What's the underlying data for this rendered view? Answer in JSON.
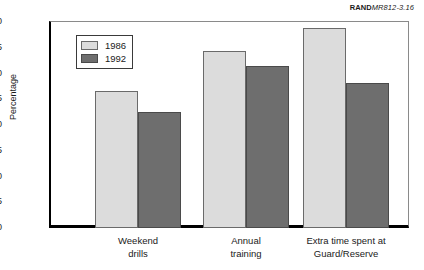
{
  "credit": {
    "rand": "RAND",
    "document": "MR812-3.16"
  },
  "chart_data": {
    "type": "bar",
    "title": "",
    "xlabel": "",
    "ylabel": "Percentage",
    "ylim": [
      0,
      40
    ],
    "ytick_step": 5,
    "yminor_step": 2.5,
    "grid": false,
    "legend_position": "upper-left-inside",
    "categories": [
      "Weekend\ndrills",
      "Annual\ntraining",
      "Extra time spent at\nGuard/Reserve"
    ],
    "ytick_labels": [
      "0",
      "5",
      "10",
      "15",
      "20",
      "25",
      "30",
      "35",
      "40"
    ],
    "series": [
      {
        "name": "1986",
        "color": "#dcdcdc",
        "values": [
          26.6,
          34.3,
          38.8
        ]
      },
      {
        "name": "1992",
        "color": "#6e6e6e",
        "values": [
          22.6,
          31.5,
          28.2
        ]
      }
    ]
  }
}
